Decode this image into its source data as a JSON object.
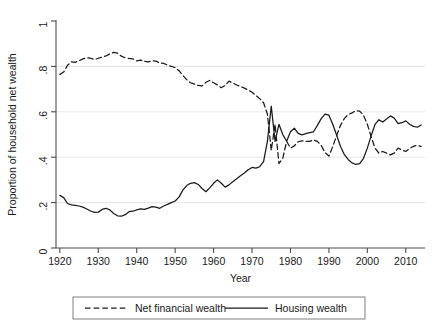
{
  "chart_data": {
    "type": "line",
    "title": "",
    "xlabel": "Year",
    "ylabel": "Proportion of household net wealth",
    "xlim": [
      1919,
      2015
    ],
    "ylim": [
      0,
      1
    ],
    "xticks": [
      1920,
      1930,
      1940,
      1950,
      1960,
      1970,
      1980,
      1990,
      2000,
      2010
    ],
    "xtick_labels": [
      "1920",
      "1930",
      "1940",
      "1950",
      "1960",
      "1970",
      "1980",
      "1990",
      "2000",
      "2010"
    ],
    "yticks": [
      0,
      0.2,
      0.4,
      0.6,
      0.8,
      1
    ],
    "ytick_labels": [
      "0",
      ".2",
      ".4",
      ".6",
      ".8",
      "1"
    ],
    "gridlines_y": [
      0.2,
      0.4,
      0.6,
      0.8
    ],
    "grid": true,
    "legend_position": "below",
    "line_color": "#1a1a1a",
    "grid_color": "#e8e8e8",
    "axis_color": "#4d4d4d",
    "x": [
      1920,
      1921,
      1922,
      1923,
      1924,
      1925,
      1926,
      1927,
      1928,
      1929,
      1930,
      1931,
      1932,
      1933,
      1934,
      1935,
      1936,
      1937,
      1938,
      1939,
      1940,
      1941,
      1942,
      1943,
      1944,
      1945,
      1946,
      1947,
      1948,
      1949,
      1950,
      1951,
      1952,
      1953,
      1954,
      1955,
      1956,
      1957,
      1958,
      1959,
      1960,
      1961,
      1962,
      1963,
      1964,
      1965,
      1966,
      1967,
      1968,
      1969,
      1970,
      1971,
      1972,
      1973,
      1974,
      1975,
      1976,
      1977,
      1978,
      1979,
      1980,
      1981,
      1982,
      1983,
      1984,
      1985,
      1986,
      1987,
      1988,
      1989,
      1990,
      1991,
      1992,
      1993,
      1994,
      1995,
      1996,
      1997,
      1998,
      1999,
      2000,
      2001,
      2002,
      2003,
      2004,
      2005,
      2006,
      2007,
      2008,
      2009,
      2010,
      2011,
      2012,
      2013,
      2014
    ],
    "series": [
      {
        "name": "Net financial wealth",
        "style": "dashed",
        "values": [
          0.765,
          0.775,
          0.805,
          0.82,
          0.818,
          0.825,
          0.833,
          0.838,
          0.836,
          0.83,
          0.836,
          0.841,
          0.846,
          0.855,
          0.862,
          0.858,
          0.845,
          0.838,
          0.835,
          0.833,
          0.824,
          0.828,
          0.822,
          0.82,
          0.825,
          0.823,
          0.815,
          0.813,
          0.806,
          0.8,
          0.795,
          0.781,
          0.76,
          0.742,
          0.728,
          0.722,
          0.716,
          0.714,
          0.73,
          0.738,
          0.728,
          0.718,
          0.706,
          0.716,
          0.735,
          0.727,
          0.718,
          0.712,
          0.704,
          0.696,
          0.686,
          0.672,
          0.658,
          0.64,
          0.59,
          0.43,
          0.545,
          0.372,
          0.395,
          0.47,
          0.44,
          0.45,
          0.468,
          0.472,
          0.47,
          0.47,
          0.476,
          0.47,
          0.452,
          0.42,
          0.405,
          0.447,
          0.495,
          0.54,
          0.57,
          0.588,
          0.595,
          0.605,
          0.603,
          0.585,
          0.545,
          0.49,
          0.44,
          0.418,
          0.425,
          0.418,
          0.41,
          0.418,
          0.44,
          0.432,
          0.425,
          0.438,
          0.448,
          0.452,
          0.448
        ]
      },
      {
        "name": "Housing wealth",
        "style": "solid",
        "values": [
          0.232,
          0.222,
          0.196,
          0.19,
          0.188,
          0.185,
          0.18,
          0.172,
          0.163,
          0.157,
          0.158,
          0.17,
          0.175,
          0.168,
          0.152,
          0.142,
          0.14,
          0.147,
          0.16,
          0.162,
          0.168,
          0.172,
          0.17,
          0.176,
          0.182,
          0.18,
          0.175,
          0.185,
          0.192,
          0.2,
          0.207,
          0.224,
          0.255,
          0.275,
          0.285,
          0.288,
          0.28,
          0.262,
          0.248,
          0.265,
          0.285,
          0.3,
          0.285,
          0.268,
          0.278,
          0.292,
          0.305,
          0.318,
          0.33,
          0.345,
          0.355,
          0.352,
          0.358,
          0.38,
          0.47,
          0.625,
          0.47,
          0.545,
          0.5,
          0.47,
          0.512,
          0.528,
          0.505,
          0.498,
          0.504,
          0.508,
          0.512,
          0.54,
          0.57,
          0.59,
          0.585,
          0.545,
          0.498,
          0.448,
          0.412,
          0.39,
          0.375,
          0.368,
          0.372,
          0.395,
          0.44,
          0.495,
          0.545,
          0.565,
          0.555,
          0.568,
          0.582,
          0.572,
          0.548,
          0.552,
          0.56,
          0.545,
          0.536,
          0.532,
          0.542
        ]
      }
    ]
  },
  "legend": {
    "entries": [
      {
        "label": "Net financial wealth",
        "style": "dashed"
      },
      {
        "label": "Housing wealth",
        "style": "solid"
      }
    ]
  }
}
